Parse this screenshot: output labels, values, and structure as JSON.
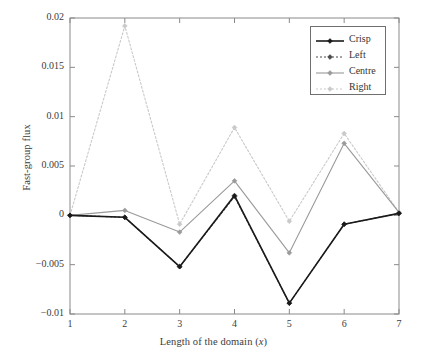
{
  "chart_data": {
    "type": "line",
    "title": "",
    "xlabel": "Length of the domain (x)",
    "xlabel_main": "Length of the domain (",
    "xlabel_italic": "x",
    "xlabel_close": ")",
    "ylabel": "Fast-group flux",
    "x": [
      1,
      2,
      3,
      4,
      5,
      6,
      7
    ],
    "xlim": [
      1,
      7
    ],
    "ylim": [
      -0.01,
      0.02
    ],
    "xticks": [
      "1",
      "2",
      "3",
      "4",
      "5",
      "6",
      "7"
    ],
    "yticks": [
      "0.02",
      "0.015",
      "0.01",
      "0.005",
      "0",
      "−0.005",
      "−0.01"
    ],
    "ytick_values": [
      0.02,
      0.015,
      0.01,
      0.005,
      0,
      -0.005,
      -0.01
    ],
    "grid": false,
    "legend_position": "top-right",
    "series": [
      {
        "name": "Crisp",
        "color": "#1a1a1a",
        "dash": "none",
        "width": 1.6,
        "marker": "diamond",
        "values": [
          0,
          -0.0002,
          -0.0052,
          0.002,
          -0.0089,
          -0.0009,
          0.0002
        ]
      },
      {
        "name": "Left",
        "color": "#4a4a4a",
        "dash": "2,2",
        "width": 1.1,
        "marker": "diamond",
        "values": [
          0,
          -0.0002,
          -0.0052,
          0.0019,
          -0.0089,
          -0.0009,
          0.0002
        ]
      },
      {
        "name": "Centre",
        "color": "#9a9a9a",
        "dash": "none",
        "width": 1.1,
        "marker": "diamond",
        "values": [
          0,
          0.0005,
          -0.0017,
          0.0035,
          -0.0038,
          0.0073,
          0.0003
        ]
      },
      {
        "name": "Right",
        "color": "#c9c9c9",
        "dash": "2,2",
        "width": 1.1,
        "marker": "diamond",
        "values": [
          0,
          0.0192,
          -0.0009,
          0.0089,
          -0.0006,
          0.0083,
          0.0003
        ]
      }
    ]
  },
  "legend": {
    "entries": [
      {
        "label": "Crisp"
      },
      {
        "label": "Left"
      },
      {
        "label": "Centre"
      },
      {
        "label": "Right"
      }
    ]
  }
}
